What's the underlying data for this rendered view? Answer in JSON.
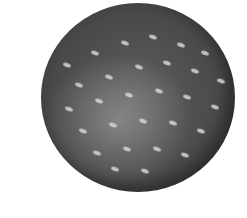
{
  "image": {
    "subject": "golf-ball",
    "background_color": "#ffffff",
    "ball_color": "#4a4a4a",
    "highlight_color": "#dcdcdc",
    "dimples": [
      [
        22,
        60
      ],
      [
        50,
        48
      ],
      [
        80,
        38
      ],
      [
        108,
        32
      ],
      [
        136,
        40
      ],
      [
        160,
        48
      ],
      [
        34,
        80
      ],
      [
        64,
        72
      ],
      [
        94,
        62
      ],
      [
        122,
        58
      ],
      [
        150,
        66
      ],
      [
        176,
        76
      ],
      [
        24,
        104
      ],
      [
        54,
        96
      ],
      [
        84,
        90
      ],
      [
        114,
        86
      ],
      [
        142,
        92
      ],
      [
        170,
        102
      ],
      [
        38,
        126
      ],
      [
        68,
        120
      ],
      [
        98,
        116
      ],
      [
        128,
        118
      ],
      [
        156,
        126
      ],
      [
        52,
        148
      ],
      [
        82,
        144
      ],
      [
        112,
        144
      ],
      [
        140,
        150
      ],
      [
        100,
        166
      ],
      [
        70,
        164
      ]
    ]
  }
}
